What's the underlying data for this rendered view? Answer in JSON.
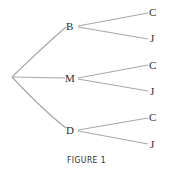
{
  "diagram": {
    "type": "tree",
    "root": "",
    "level1": [
      {
        "label": "B",
        "children": [
          "C",
          "J"
        ]
      },
      {
        "label": "M",
        "children": [
          "C",
          "J"
        ]
      },
      {
        "label": "D",
        "children": [
          "C",
          "J"
        ]
      }
    ],
    "caption": "FIGURE 1",
    "line_color": "#a8a8a8"
  }
}
